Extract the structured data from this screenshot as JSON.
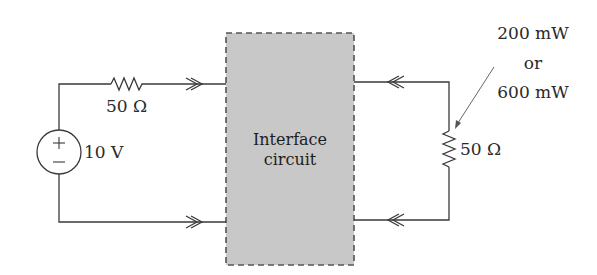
{
  "diagram": {
    "type": "circuit-schematic",
    "source": {
      "label": "10 V",
      "plus_sign": "+",
      "minus_sign": "−"
    },
    "source_resistor": {
      "label": "50 Ω"
    },
    "interface_block": {
      "line1": "Interface",
      "line2": "circuit",
      "fill_color": "#c8c8c8",
      "border_style": "dashed"
    },
    "load_resistor": {
      "label": "50 Ω"
    },
    "power_annotation": {
      "line1": "200 mW",
      "line2": "or",
      "line3": "600 mW"
    },
    "colors": {
      "wire": "#3a3a3a",
      "background": "#ffffff"
    }
  }
}
